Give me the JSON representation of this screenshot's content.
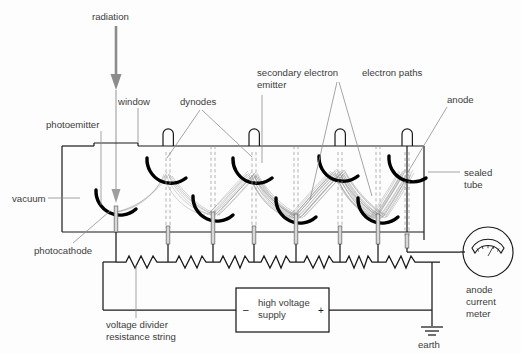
{
  "figure": {
    "background_color": "#fdfdfd",
    "label_color": "#3c3c3c",
    "wire_color": "#1a1a1a",
    "electron_path_color": "#9b9b9b",
    "radiation_color": "#8c8c8c"
  },
  "labels": {
    "radiation": "radiation",
    "window": "window",
    "dynodes": "dynodes",
    "photoemitter": "photoemitter",
    "secondary_electron_emitter_line1": "secondary electron",
    "secondary_electron_emitter_line2": "emitter",
    "electron_paths": "electron paths",
    "anode": "anode",
    "sealed_tube_line1": "sealed",
    "sealed_tube_line2": "tube",
    "vacuum": "vacuum",
    "photocathode": "photocathode",
    "voltage_divider_line1": "voltage divider",
    "voltage_divider_line2": "resistance string",
    "high_voltage_supply_line1": "high voltage",
    "high_voltage_supply_line2": "supply",
    "supply_negative": "–",
    "supply_positive": "+",
    "earth": "earth",
    "anode_current_meter_line1": "anode",
    "anode_current_meter_line2": "current",
    "anode_current_meter_line3": "meter"
  },
  "components": {
    "dynode_count": 6,
    "resistor_count": 7,
    "electrode_sequence": [
      "photocathode",
      "dynode",
      "dynode",
      "dynode",
      "dynode",
      "dynode",
      "dynode",
      "anode"
    ],
    "meter_type": "analogue-moving-coil",
    "earth_symbol_bars": 3
  }
}
